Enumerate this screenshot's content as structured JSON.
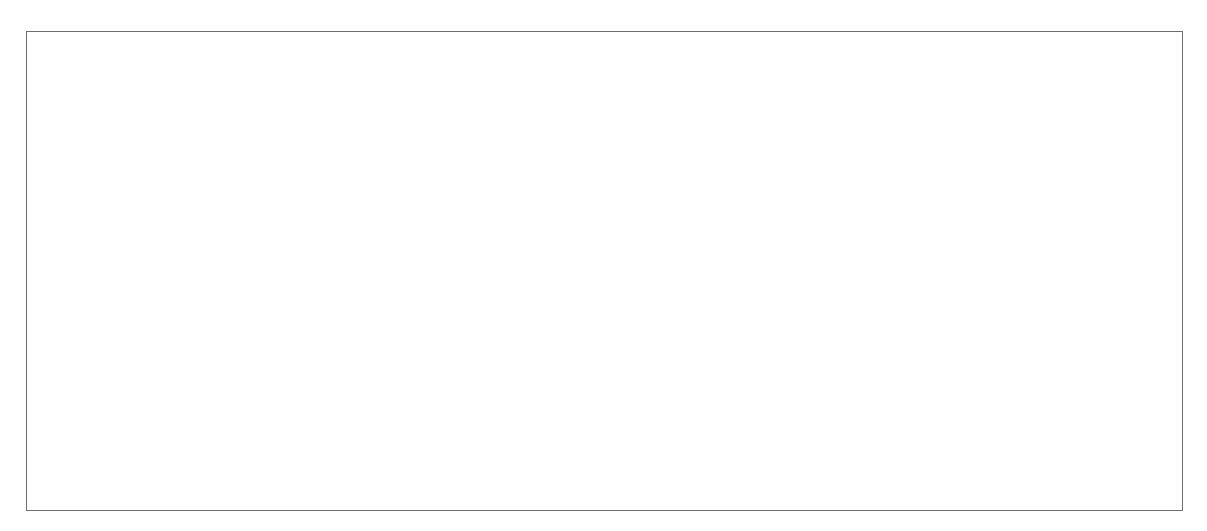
{
  "figure": {
    "kind": "two-panel-medical-figure",
    "panels": [
      {
        "id": "schematic",
        "kind": "line-drawing-schematic",
        "description": "Grey-shaded schematic drawing of the hip (pelvis, acetabulum and proximal femur) in lateral projection with a surgical clamp and a curved retractor overlaid, annotated with reference lines and letters."
      },
      {
        "id": "radiograph",
        "kind": "fluoroscopic-radiograph",
        "description": "Greyscale intra-operative fluoroscopic image of the same hip region, octagonal image-intensifier field, with the identical letter annotations and reference lines overlaid."
      }
    ]
  },
  "labels": {
    "schematic": [
      {
        "id": "A",
        "text": "A",
        "x": 44,
        "y": 340,
        "kind": "line-label",
        "line": "lower-horizontal-dashed"
      },
      {
        "id": "B",
        "text": "B",
        "x": 44,
        "y": 283,
        "kind": "line-label",
        "line": "upper-horizontal-dashed"
      },
      {
        "id": "C",
        "text": "C",
        "x": 240,
        "y": 82,
        "kind": "leader-label",
        "leader_to_x": 236,
        "leader_to_y": 160
      },
      {
        "id": "D",
        "text": "D",
        "x": 86,
        "y": 150,
        "kind": "arrow-label",
        "arrow_to_x": 166,
        "arrow_to_y": 162
      },
      {
        "id": "E",
        "text": "E",
        "x": 386,
        "y": 410,
        "kind": "leader-label",
        "leader_to_x": 344,
        "leader_to_y": 300
      },
      {
        "id": "F",
        "text": "F",
        "x": 40,
        "y": 192,
        "kind": "curve-label",
        "line": "dotted-curve"
      }
    ],
    "radiograph": [
      {
        "id": "A",
        "text": "A",
        "x": 620,
        "y": 339,
        "kind": "line-label",
        "line": "lower-horizontal-dashed"
      },
      {
        "id": "B",
        "text": "B",
        "x": 619,
        "y": 277,
        "kind": "line-label",
        "line": "upper-horizontal-dashed"
      },
      {
        "id": "C",
        "text": "C",
        "x": 932,
        "y": 192,
        "kind": "leader-label",
        "leader_to_x": 888,
        "leader_to_y": 236
      },
      {
        "id": "D",
        "text": "D",
        "x": 668,
        "y": 150,
        "kind": "arrow-label",
        "arrow_to_x": 742,
        "arrow_to_y": 163
      },
      {
        "id": "E",
        "text": "E",
        "x": 907,
        "y": 346,
        "kind": "leader-label",
        "leader_to_x": 897,
        "leader_to_y": 294
      },
      {
        "id": "F",
        "text": "F",
        "x": 606,
        "y": 210,
        "kind": "curve-label",
        "line": "dotted-curve"
      }
    ]
  },
  "annotation_lines": {
    "schematic": {
      "line_A": {
        "x1": 70,
        "y1": 352,
        "x2": 344,
        "y2": 352,
        "style": "dashed",
        "color": "#9a9a9e"
      },
      "line_B": {
        "x1": 70,
        "y1": 297,
        "x2": 348,
        "y2": 297,
        "style": "dashed",
        "color": "#9a9a9e"
      },
      "curve_F": {
        "style": "dotted",
        "color": "#6b6b70",
        "path": "M 64 222 C 96 268, 128 318, 172 372 C 212 420, 268 448, 330 460 C 372 468, 410 468, 436 462"
      },
      "curve_C": {
        "style": "dashed",
        "color": "#6b6b70",
        "path": "M 152 110 C 200 160, 256 214, 312 264 C 368 314, 424 360, 468 396"
      }
    },
    "radiograph": {
      "line_A": {
        "x1": 658,
        "y1": 351,
        "x2": 877,
        "y2": 351,
        "style": "dashed",
        "color": "#f0f0ec"
      },
      "line_B": {
        "x1": 658,
        "y1": 289,
        "x2": 892,
        "y2": 289,
        "style": "dashed",
        "color": "#f0f0ec"
      },
      "curve_F": {
        "style": "dotted",
        "color": "#1d1d1f",
        "path": "M 627 232 C 642 282, 660 332, 688 376 C 716 418, 762 452, 820 468 C 860 478, 898 478, 922 472"
      },
      "curve_C": {
        "style": "dashed",
        "color": "#f0f0ec",
        "path": "M 716 96 C 760 150, 812 208, 862 254 C 920 308, 1000 372, 1065 420"
      }
    }
  },
  "markers": {
    "schematic": {
      "radiopaque_bead": {
        "cx": 277,
        "cy": 315,
        "rx": 11,
        "ry": 13,
        "color": "#f4f4f0"
      }
    },
    "radiograph": {
      "radiopaque_bead": {
        "cx": 824,
        "cy": 310,
        "rx": 13,
        "ry": 16,
        "color": "#fbfbf7"
      }
    }
  },
  "colors": {
    "bone_fill": "#c2c2c2",
    "bone_outline": "#6d6d70",
    "instrument": "#7b7b7e",
    "instrument_dark": "#6a6a6d",
    "frame": "#6e6e70",
    "label_dark": "#3a3a3c",
    "label_light": "#f2f2ee",
    "page_background": "#ffffff",
    "xray_dark": "#3b3b3b",
    "xray_mid": "#8c8c8c",
    "xray_bright": "#e8e8e4"
  }
}
